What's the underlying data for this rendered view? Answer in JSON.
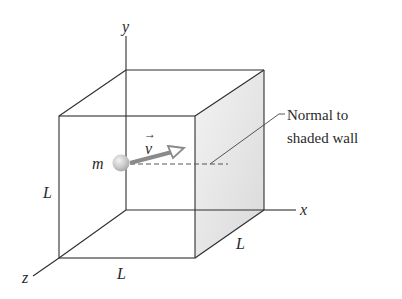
{
  "figure": {
    "type": "3d-box-diagram",
    "axes": {
      "x_label": "x",
      "y_label": "y",
      "z_label": "z"
    },
    "dimensions": {
      "left_edge_label": "L",
      "bottom_edge_label": "L",
      "depth_edge_label": "L"
    },
    "particle": {
      "mass_label": "m",
      "velocity_label": "v",
      "velocity_arrow_symbol": "→"
    },
    "annotation": {
      "line1": "Normal to",
      "line2": "shaded wall"
    },
    "colors": {
      "edges": "#2f2f2f",
      "shaded_wall": "#e4e4e4",
      "particle": "#c8c8c8",
      "velocity_arrow": "#8a8a8a",
      "background": "#ffffff"
    }
  }
}
